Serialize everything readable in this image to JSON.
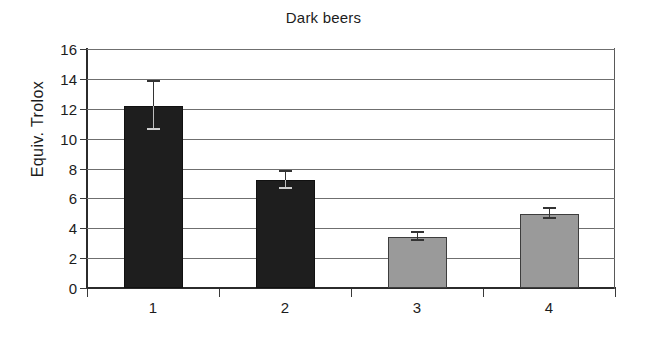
{
  "chart_data": {
    "type": "bar",
    "title": "Dark beers",
    "xlabel": "",
    "ylabel": "Equiv. Trolox",
    "categories": [
      "1",
      "2",
      "3",
      "4"
    ],
    "values": [
      12.2,
      7.2,
      3.4,
      4.95
    ],
    "errors": [
      1.6,
      0.6,
      0.27,
      0.35
    ],
    "bar_colors": [
      "#1e1e1e",
      "#1e1e1e",
      "#9a9a9a",
      "#9a9a9a"
    ],
    "ylim": [
      0,
      16
    ],
    "ytick_labels": [
      "0",
      "2",
      "4",
      "6",
      "8",
      "10",
      "12",
      "14",
      "16"
    ],
    "ytick_values": [
      0,
      2,
      4,
      6,
      8,
      10,
      12,
      14,
      16
    ],
    "grid": "horizontal",
    "legend": "none",
    "error_bar_style": "symmetric-caps",
    "background": "#ffffff",
    "axis_color": "#2b2b2b",
    "gridline_color": "#6f6f6f"
  }
}
